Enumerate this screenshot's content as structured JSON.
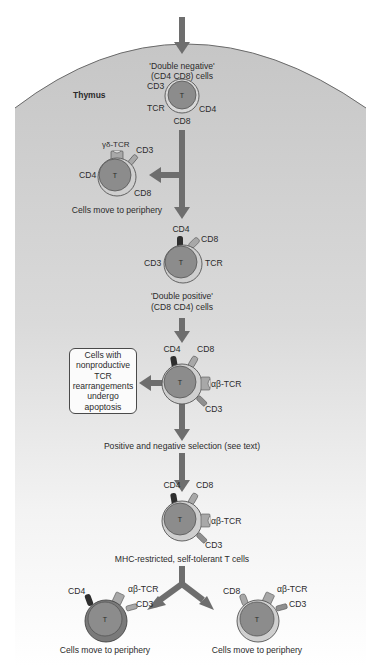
{
  "thymus": {
    "label": "Thymus"
  },
  "stages": {
    "double_negative": {
      "title": "'Double negative'",
      "subtitle": "(CD4 CD8) cells",
      "cell_letter": "T",
      "markers": {
        "cd3": "CD3",
        "tcr": "TCR",
        "cd4": "CD4",
        "cd8": "CD8"
      }
    },
    "gamma_delta": {
      "cell_letter": "T",
      "markers": {
        "tcr": "γδ-TCR",
        "cd3": "CD3",
        "cd4": "CD4",
        "cd8": "CD8"
      },
      "caption": "Cells move to periphery"
    },
    "double_positive": {
      "title": "'Double positive'",
      "subtitle": "(CD8 CD4) cells",
      "cell_letter": "T",
      "markers": {
        "cd4": "CD4",
        "cd8": "CD8",
        "cd3": "CD3",
        "tcr": "TCR"
      }
    },
    "alpha_beta": {
      "cell_letter": "T",
      "markers": {
        "cd4": "CD4",
        "cd8": "CD8",
        "tcr": "αβ-TCR",
        "cd3": "CD3"
      },
      "apoptosis_box": [
        "Cells with",
        "nonproductive",
        "TCR",
        "rearrangements",
        "undergo",
        "apoptosis"
      ],
      "selection_label": "Positive and negative selection (see text)"
    },
    "mhc_restricted": {
      "cell_letter": "T",
      "markers": {
        "cd4": "CD4",
        "cd8": "CD8",
        "tcr": "αβ-TCR",
        "cd3": "CD3"
      },
      "caption": "MHC-restricted, self-tolerant T cells"
    },
    "cd4_single": {
      "cell_letter": "T",
      "markers": {
        "cd4": "CD4",
        "tcr": "αβ-TCR",
        "cd3": "CD3"
      },
      "caption": "Cells move to periphery"
    },
    "cd8_single": {
      "cell_letter": "T",
      "markers": {
        "cd8": "CD8",
        "tcr": "αβ-TCR",
        "cd3": "CD3"
      },
      "caption": "Cells move to periphery"
    }
  },
  "colors": {
    "thymus_top": "#c9c9c9",
    "thymus_bottom": "#ffffff",
    "arrow": "#6e6e6e",
    "cell_nucleus": "#8c8c8c",
    "cell_membrane": "#c2c2c2",
    "cd4_marker": "#2e2e2e",
    "receptor": "#a8a8a8"
  }
}
